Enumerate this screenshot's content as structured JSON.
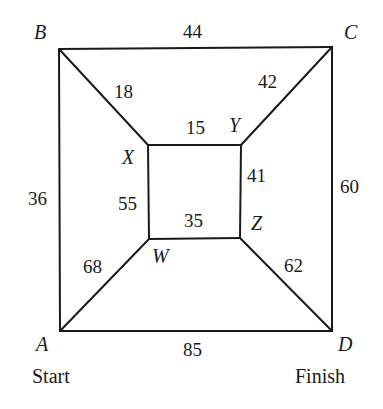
{
  "diagram": {
    "type": "weighted-graph",
    "vertices": [
      {
        "id": "A",
        "label": "A",
        "caption": "Start",
        "x": 60,
        "y": 331
      },
      {
        "id": "B",
        "label": "B",
        "x": 59,
        "y": 49
      },
      {
        "id": "C",
        "label": "C",
        "x": 332,
        "y": 47
      },
      {
        "id": "D",
        "label": "D",
        "caption": "Finish",
        "x": 332,
        "y": 331
      },
      {
        "id": "X",
        "label": "X",
        "x": 148,
        "y": 145
      },
      {
        "id": "Y",
        "label": "Y",
        "x": 241,
        "y": 145
      },
      {
        "id": "Z",
        "label": "Z",
        "x": 240,
        "y": 238
      },
      {
        "id": "W",
        "label": "W",
        "x": 149,
        "y": 239
      }
    ],
    "edges": [
      {
        "from": "B",
        "to": "C",
        "weight": "44"
      },
      {
        "from": "A",
        "to": "B",
        "weight": "36"
      },
      {
        "from": "C",
        "to": "D",
        "weight": "60"
      },
      {
        "from": "A",
        "to": "D",
        "weight": "85"
      },
      {
        "from": "B",
        "to": "X",
        "weight": "18"
      },
      {
        "from": "C",
        "to": "Y",
        "weight": "42"
      },
      {
        "from": "A",
        "to": "W",
        "weight": "68"
      },
      {
        "from": "D",
        "to": "Z",
        "weight": "62"
      },
      {
        "from": "X",
        "to": "Y",
        "weight": "15"
      },
      {
        "from": "Y",
        "to": "Z",
        "weight": "41"
      },
      {
        "from": "W",
        "to": "Z",
        "weight": "35"
      },
      {
        "from": "X",
        "to": "W",
        "weight": "55"
      }
    ],
    "start_label": "Start",
    "finish_label": "Finish"
  }
}
